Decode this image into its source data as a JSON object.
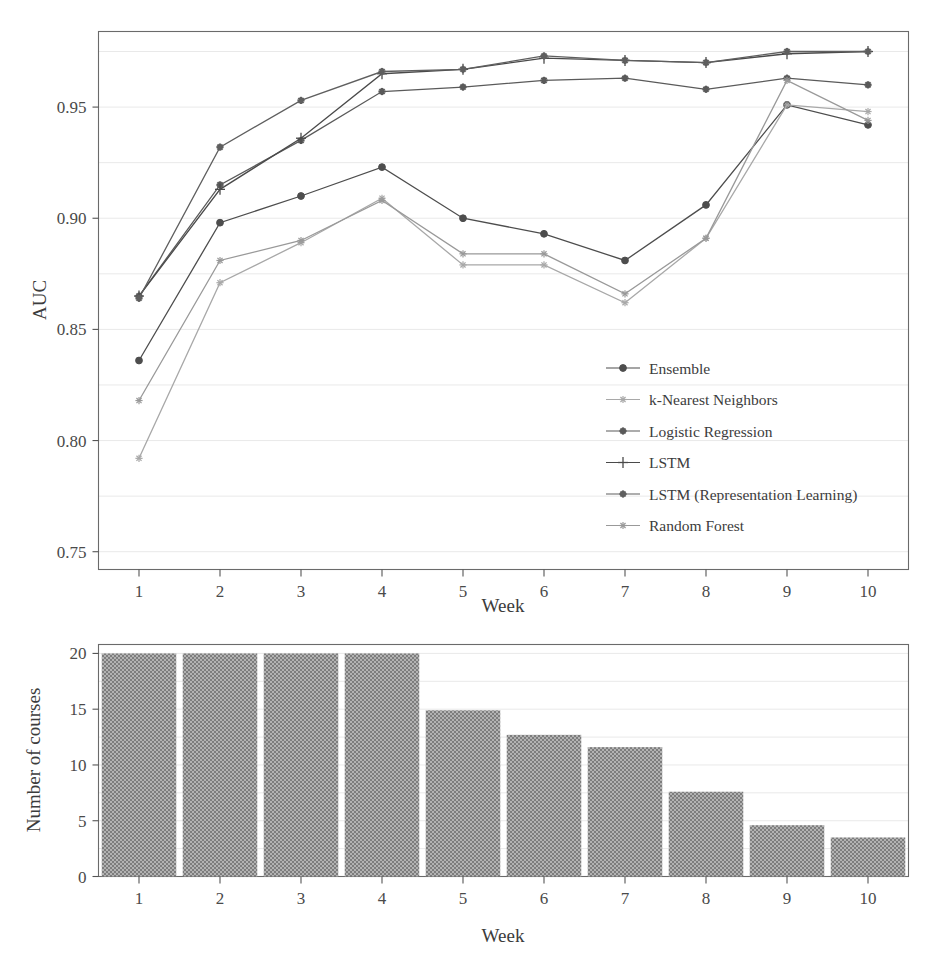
{
  "figure": {
    "background_color": "#ffffff",
    "panels": [
      "auc-line-panel",
      "course-count-bar-panel"
    ]
  },
  "chart_data": [
    {
      "type": "line",
      "title": "",
      "xlabel": "Week",
      "ylabel": "AUC",
      "x": [
        1,
        2,
        3,
        4,
        5,
        6,
        7,
        8,
        9,
        10
      ],
      "xtick_labels": [
        "1",
        "2",
        "3",
        "4",
        "5",
        "6",
        "7",
        "8",
        "9",
        "10"
      ],
      "ytick_labels": [
        "0.75",
        "0.80",
        "0.85",
        "0.90",
        "0.95"
      ],
      "ytick_values": [
        0.75,
        0.8,
        0.85,
        0.9,
        0.95
      ],
      "ylim": [
        0.742,
        0.984
      ],
      "xlim": [
        0.5,
        10.5
      ],
      "grid": true,
      "legend_position": "center-right inside axes",
      "series": [
        {
          "name": "Ensemble",
          "marker": "filled-circle",
          "color": "#4d4d4d",
          "values": [
            0.836,
            0.898,
            0.91,
            0.923,
            0.9,
            0.893,
            0.881,
            0.906,
            0.951,
            0.942
          ]
        },
        {
          "name": "k-Nearest Neighbors",
          "marker": "light-star",
          "color": "#a8a8a8",
          "values": [
            0.792,
            0.871,
            0.889,
            0.909,
            0.879,
            0.879,
            0.862,
            0.891,
            0.951,
            0.948
          ]
        },
        {
          "name": "Logistic Regression",
          "marker": "dark-star",
          "color": "#5a5a5a",
          "values": [
            0.865,
            0.915,
            0.935,
            0.957,
            0.959,
            0.962,
            0.963,
            0.958,
            0.963,
            0.96
          ]
        },
        {
          "name": "LSTM",
          "marker": "plus",
          "color": "#4a4a4a",
          "values": [
            0.865,
            0.913,
            0.936,
            0.965,
            0.967,
            0.972,
            0.971,
            0.97,
            0.974,
            0.975
          ]
        },
        {
          "name": "LSTM (Representation Learning)",
          "marker": "dark-star",
          "color": "#5f5f5f",
          "values": [
            0.864,
            0.932,
            0.953,
            0.966,
            0.967,
            0.973,
            0.971,
            0.97,
            0.975,
            0.975
          ]
        },
        {
          "name": "Random Forest",
          "marker": "light-asterisk",
          "color": "#999999",
          "values": [
            0.818,
            0.881,
            0.89,
            0.908,
            0.884,
            0.884,
            0.866,
            0.891,
            0.962,
            0.944
          ]
        }
      ]
    },
    {
      "type": "bar",
      "title": "",
      "xlabel": "Week",
      "ylabel": "Number of courses",
      "categories": [
        "1",
        "2",
        "3",
        "4",
        "5",
        "6",
        "7",
        "8",
        "9",
        "10"
      ],
      "values": [
        20,
        20,
        20,
        20,
        14.9,
        12.7,
        11.6,
        7.6,
        4.6,
        3.5
      ],
      "ytick_labels": [
        "0",
        "5",
        "10",
        "15",
        "20"
      ],
      "ytick_values": [
        0,
        5,
        10,
        15,
        20
      ],
      "ylim": [
        0,
        20.8
      ],
      "xlim": [
        0.5,
        10.5
      ],
      "grid": true,
      "bar_color": "#9b9b9b"
    }
  ],
  "line_panel": {
    "y_axis_title": "AUC",
    "x_axis_title": "Week",
    "y_tick_labels": [
      "0.95",
      "0.90",
      "0.85",
      "0.80",
      "0.75"
    ],
    "x_tick_labels": [
      "1",
      "2",
      "3",
      "4",
      "5",
      "6",
      "7",
      "8",
      "9",
      "10"
    ],
    "legend": {
      "items": [
        {
          "label": "Ensemble",
          "marker": "filled-circle"
        },
        {
          "label": "k-Nearest Neighbors",
          "marker": "light-star"
        },
        {
          "label": "Logistic Regression",
          "marker": "dark-star"
        },
        {
          "label": "LSTM",
          "marker": "plus"
        },
        {
          "label": "LSTM (Representation Learning)",
          "marker": "dark-star"
        },
        {
          "label": "Random Forest",
          "marker": "light-asterisk"
        }
      ]
    }
  },
  "bar_panel": {
    "y_axis_title": "Number of courses",
    "x_axis_title": "Week",
    "y_tick_labels": [
      "20",
      "15",
      "10",
      "5",
      "0"
    ],
    "x_tick_labels": [
      "1",
      "2",
      "3",
      "4",
      "5",
      "6",
      "7",
      "8",
      "9",
      "10"
    ]
  }
}
